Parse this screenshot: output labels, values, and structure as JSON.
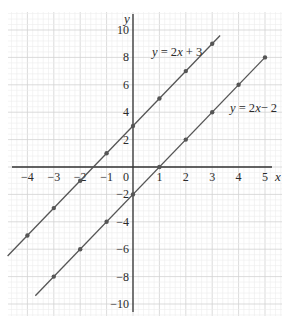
{
  "chart_data": {
    "type": "line",
    "title": "",
    "xlabel": "x",
    "ylabel": "y",
    "xlim": [
      -4.5,
      5.3
    ],
    "ylim": [
      -10.5,
      10.5
    ],
    "grid": true,
    "x_ticks": [
      -4,
      -3,
      -2,
      -1,
      0,
      1,
      2,
      3,
      4,
      5
    ],
    "y_ticks": [
      -10,
      -8,
      -6,
      -4,
      -2,
      2,
      4,
      6,
      8,
      10
    ],
    "series": [
      {
        "name": "y = 2x + 3",
        "label_parts": [
          "y",
          " = 2",
          "x",
          " + 3"
        ],
        "points": [
          [
            -4,
            -5
          ],
          [
            -3,
            -3
          ],
          [
            -2,
            -1
          ],
          [
            -1,
            1
          ],
          [
            0,
            3
          ],
          [
            1,
            5
          ],
          [
            2,
            7
          ],
          [
            3,
            9
          ]
        ],
        "line_extent": [
          -4.75,
          3.3
        ],
        "color": "#555555"
      },
      {
        "name": "y = 2x - 2",
        "label_parts": [
          "y",
          " = 2",
          "x",
          "− 2"
        ],
        "points": [
          [
            -3,
            -8
          ],
          [
            -2,
            -6
          ],
          [
            -1,
            -4
          ],
          [
            0,
            -2
          ],
          [
            1,
            0
          ],
          [
            2,
            2
          ],
          [
            3,
            4
          ],
          [
            4,
            6
          ],
          [
            5,
            8
          ]
        ],
        "line_extent": [
          -3.7,
          5
        ],
        "color": "#555555"
      }
    ]
  },
  "labels": {
    "x_axis": "x",
    "y_axis": "y",
    "origin": "0"
  }
}
